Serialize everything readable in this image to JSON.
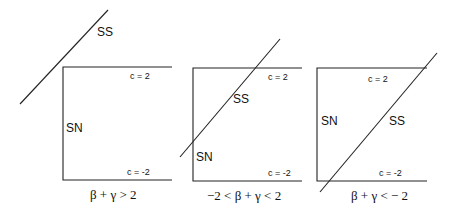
{
  "panels": [
    {
      "condition": "β + γ > 2",
      "labels": {
        "top": "c = 2",
        "bottom": "c = -2",
        "ss": "SS",
        "sn": "SN"
      }
    },
    {
      "condition": "−2 < β + γ < 2",
      "labels": {
        "top": "c = 2",
        "bottom": "c = -2",
        "ss": "SS",
        "sn": "SN"
      }
    },
    {
      "condition": "β + γ < − 2",
      "labels": {
        "top": "c = 2",
        "bottom": "c = -2",
        "ss": "SS",
        "sn": "SN"
      }
    }
  ],
  "colors": {
    "line": "#222222",
    "text": "#111111",
    "background": "#ffffff"
  }
}
